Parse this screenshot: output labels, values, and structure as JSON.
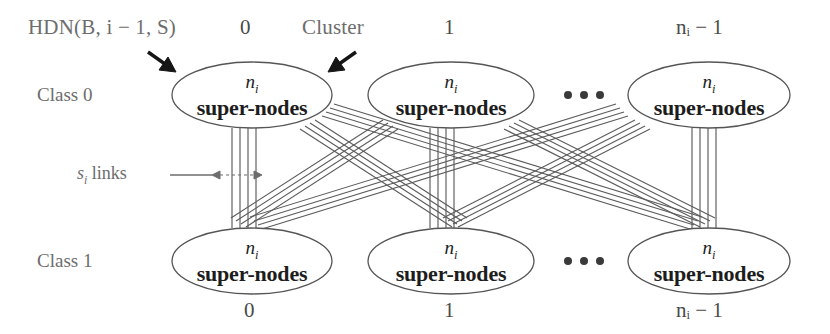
{
  "figure": {
    "title_label": "HDN(B, i − 1, S)",
    "cluster_label": "Cluster",
    "links_label_var": "s",
    "links_label_sub": "i",
    "links_label_text": " links",
    "row_labels": [
      {
        "name": "class-0",
        "text": "Class 0"
      },
      {
        "name": "class-1",
        "text": "Class 1"
      }
    ],
    "top_indices": [
      "0",
      "1",
      "nᵢ − 1"
    ],
    "bottom_indices": [
      "0",
      "1",
      "nᵢ − 1"
    ],
    "ellipsis": "•••",
    "node": {
      "count_var": "n",
      "count_sub": "i",
      "caption": "super-nodes"
    },
    "nodes": [
      {
        "name": "class0-cluster-0",
        "row": "Class 0",
        "index": "0",
        "count": "nᵢ",
        "caption": "super-nodes"
      },
      {
        "name": "class0-cluster-1",
        "row": "Class 0",
        "index": "1",
        "count": "nᵢ",
        "caption": "super-nodes"
      },
      {
        "name": "class0-cluster-last",
        "row": "Class 0",
        "index": "nᵢ − 1",
        "count": "nᵢ",
        "caption": "super-nodes"
      },
      {
        "name": "class1-cluster-0",
        "row": "Class 1",
        "index": "0",
        "count": "nᵢ",
        "caption": "super-nodes"
      },
      {
        "name": "class1-cluster-1",
        "row": "Class 1",
        "index": "1",
        "count": "nᵢ",
        "caption": "super-nodes"
      },
      {
        "name": "class1-cluster-last",
        "row": "Class 1",
        "index": "nᵢ − 1",
        "count": "nᵢ",
        "caption": "super-nodes"
      }
    ],
    "colors": {
      "stroke": "#585858",
      "text_light": "#6d6d6d",
      "text_dark": "#1d1d1d",
      "arrow": "#1a1a1a",
      "background": "#ffffff"
    },
    "links_per_bundle": 4
  }
}
